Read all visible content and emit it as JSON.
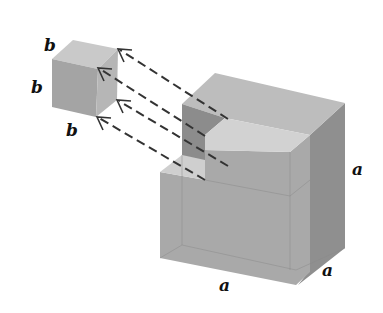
{
  "figure": {
    "small_cube": {
      "labels": [
        "b",
        "b",
        "b"
      ],
      "colors": {
        "top": "#c9c9c9",
        "front": "#a4a4a4",
        "side": "#b6b6b6"
      }
    },
    "large_cube": {
      "labels": [
        "a",
        "a",
        "a"
      ],
      "colors": {
        "top": "#bdbdbd",
        "front": "#a9a9a9",
        "side": "#8f8f8f",
        "notch_wall": "#8c8c8c",
        "notch_floor": "#cfcfcf"
      }
    },
    "arrows": [
      {
        "from": [
          228,
          119
        ],
        "to": [
          118,
          49
        ]
      },
      {
        "from": [
          205,
          136
        ],
        "to": [
          98,
          68
        ]
      },
      {
        "from": [
          228,
          166
        ],
        "to": [
          117,
          100
        ]
      },
      {
        "from": [
          205,
          180
        ],
        "to": [
          97,
          117
        ]
      }
    ]
  }
}
